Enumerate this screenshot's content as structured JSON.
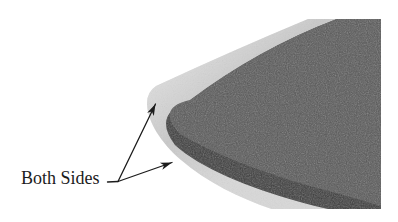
{
  "figure": {
    "label": "Both Sides",
    "colors": {
      "background": "#ffffff",
      "panel_top": "#575757",
      "panel_edge": "#3c3c3c",
      "laminate_band": "#c9c9c9",
      "annotation": "#1c1c1c"
    }
  }
}
